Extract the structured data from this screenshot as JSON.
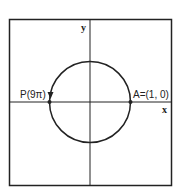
{
  "diagram": {
    "type": "unit-circle",
    "axes": {
      "x_label": "x",
      "y_label": "y"
    },
    "points": {
      "A": {
        "label": "A=(1, 0)",
        "x": 1,
        "y": 0
      },
      "P": {
        "label": "P(9π)",
        "x": -1,
        "y": 0
      }
    },
    "arrow_direction": "counterclockwise",
    "colors": {
      "stroke": "#222222",
      "background": "#ffffff"
    }
  }
}
